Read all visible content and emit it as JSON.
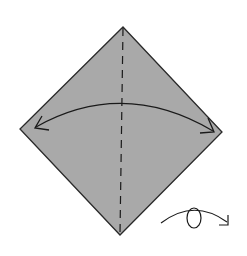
{
  "diagram": {
    "type": "origami-step",
    "colors": {
      "background": "#ffffff",
      "paper": "#a9a9a9",
      "outline": "#2a2a2a",
      "lines": "#1a1a1a"
    },
    "paper": {
      "shape": "diamond",
      "vertices": {
        "top": [
          123,
          27
        ],
        "right": [
          222,
          132
        ],
        "bottom": [
          120,
          235
        ],
        "left": [
          20,
          129
        ]
      }
    },
    "fold_line": {
      "style": "dashed",
      "kind": "valley-fold",
      "from": [
        123,
        27
      ],
      "to": [
        120,
        235
      ]
    },
    "fold_arrow": {
      "kind": "double-headed-arc",
      "from": [
        35,
        128
      ],
      "apex": [
        123,
        103
      ],
      "to": [
        214,
        131
      ]
    },
    "turn_over_symbol": {
      "kind": "turn-over-arrow",
      "arc_from": [
        161,
        223
      ],
      "arc_to": [
        228,
        224
      ],
      "loop_center": [
        195,
        217
      ]
    }
  }
}
